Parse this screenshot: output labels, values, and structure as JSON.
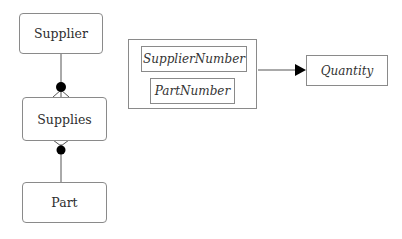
{
  "diagram": {
    "type": "entity-relationship / functional dependency",
    "entities": [
      {
        "id": "supplier",
        "label": "Supplier"
      },
      {
        "id": "supplies",
        "label": "Supplies"
      },
      {
        "id": "part",
        "label": "Part"
      }
    ],
    "relationships": [
      {
        "from": "supplier",
        "to": "supplies",
        "cardinality": "one-to-many",
        "notation": "filled dot + crow's foot at Supplies"
      },
      {
        "from": "part",
        "to": "supplies",
        "cardinality": "one-to-many",
        "notation": "filled dot + crow's foot at Supplies"
      }
    ],
    "dependency": {
      "determinant_group": [
        {
          "id": "supplier_number",
          "label": "SupplierNumber"
        },
        {
          "id": "part_number",
          "label": "PartNumber"
        }
      ],
      "dependent": {
        "id": "quantity",
        "label": "Quantity"
      },
      "arrow": "determinant-to-dependent"
    },
    "colors": {
      "stroke": "#8a8a8a",
      "line": "#555555",
      "marker": "#000000",
      "text": "#2e2e2e"
    }
  }
}
